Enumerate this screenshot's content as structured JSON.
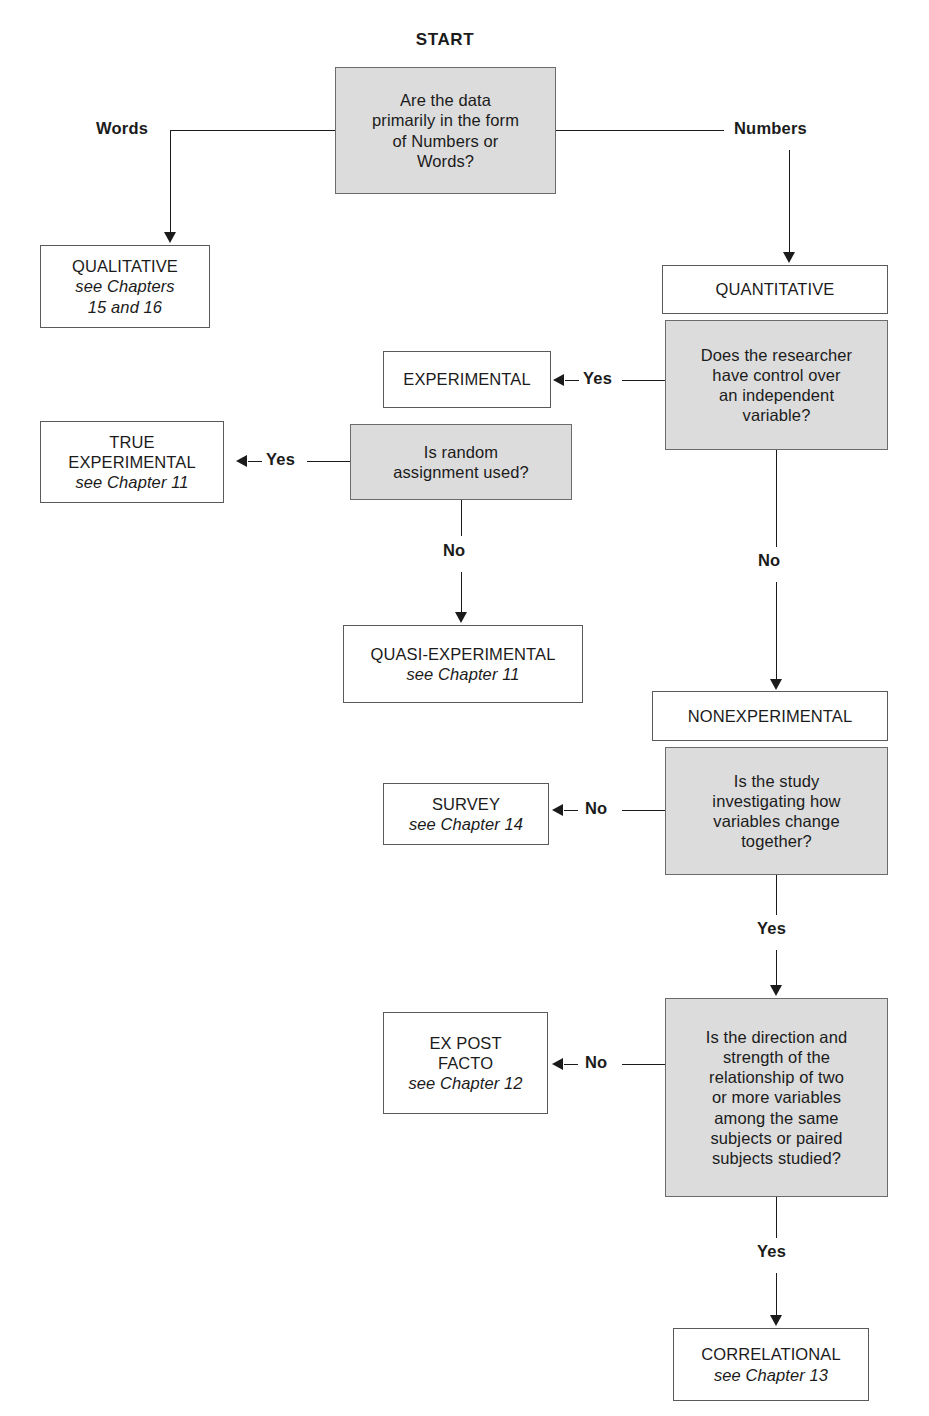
{
  "heading": {
    "start_label": "START"
  },
  "colors": {
    "decision_fill": "#dcdcdc",
    "terminal_fill": "#ffffff",
    "border": "#5a5a5a",
    "line": "#1b1b1b",
    "background": "#ffffff"
  },
  "nodes": {
    "start_question": {
      "type": "decision",
      "lines": [
        "Are the data",
        "primarily in the form",
        "of Numbers or",
        "Words?"
      ]
    },
    "qualitative": {
      "type": "terminal",
      "lines": [
        "QUALITATIVE"
      ],
      "chapters": [
        "see Chapters",
        "15 and 16"
      ]
    },
    "quantitative": {
      "type": "terminal",
      "lines": [
        "QUANTITATIVE"
      ],
      "chapters": []
    },
    "control_question": {
      "type": "decision",
      "lines": [
        "Does the researcher",
        "have control over",
        "an independent",
        "variable?"
      ]
    },
    "experimental": {
      "type": "terminal",
      "lines": [
        "EXPERIMENTAL"
      ],
      "chapters": []
    },
    "random_question": {
      "type": "decision",
      "lines": [
        "Is random",
        "assignment used?"
      ]
    },
    "true_experimental": {
      "type": "terminal",
      "lines": [
        "TRUE",
        "EXPERIMENTAL"
      ],
      "chapters": [
        "see Chapter 11"
      ]
    },
    "quasi_experimental": {
      "type": "terminal",
      "lines": [
        "QUASI-EXPERIMENTAL"
      ],
      "chapters": [
        "see Chapter 11"
      ]
    },
    "nonexperimental": {
      "type": "terminal",
      "lines": [
        "NONEXPERIMENTAL"
      ],
      "chapters": []
    },
    "change_question": {
      "type": "decision",
      "lines": [
        "Is the study",
        "investigating how",
        "variables change",
        "together?"
      ]
    },
    "survey": {
      "type": "terminal",
      "lines": [
        "SURVEY"
      ],
      "chapters": [
        "see Chapter 14"
      ]
    },
    "direction_question": {
      "type": "decision",
      "lines": [
        "Is the direction and",
        "strength of the",
        "relationship of two",
        "or more variables",
        "among the same",
        "subjects or paired",
        "subjects studied?"
      ]
    },
    "ex_post_facto": {
      "type": "terminal",
      "lines": [
        "EX POST",
        "FACTO"
      ],
      "chapters": [
        "see Chapter 12"
      ]
    },
    "correlational": {
      "type": "terminal",
      "lines": [
        "CORRELATIONAL"
      ],
      "chapters": [
        "see Chapter 13"
      ]
    }
  },
  "edge_labels": {
    "words": "Words",
    "numbers": "Numbers",
    "control_yes": "Yes",
    "control_no": "No",
    "random_yes": "Yes",
    "random_no": "No",
    "change_no": "No",
    "change_yes": "Yes",
    "direction_no": "No",
    "direction_yes": "Yes"
  }
}
